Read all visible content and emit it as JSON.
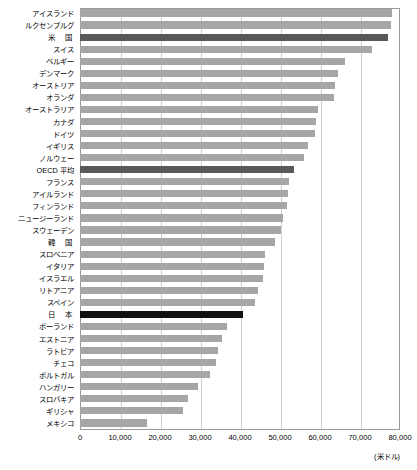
{
  "chart_data": {
    "type": "bar",
    "orientation": "horizontal",
    "title": "",
    "xlabel": "",
    "ylabel": "",
    "unit_label": "(米ドル)",
    "xlim": [
      0,
      80000
    ],
    "xticks": [
      0,
      10000,
      20000,
      30000,
      40000,
      50000,
      60000,
      70000,
      80000
    ],
    "xtick_labels": [
      "0",
      "10,000",
      "20,000",
      "30,000",
      "40,000",
      "50,000",
      "60,000",
      "70,000",
      "80,000"
    ],
    "grid": true,
    "grid_axis": "x",
    "legend": "none",
    "categories": [
      "アイスランド",
      "ルクセンブルグ",
      "米　国",
      "スイス",
      "ベルギー",
      "デンマーク",
      "オーストリア",
      "オランダ",
      "オーストラリア",
      "カナダ",
      "ドイツ",
      "イギリス",
      "ノルウェー",
      "OECD 平均",
      "フランス",
      "アイルランド",
      "フィンランド",
      "ニュージーランド",
      "スウェーデン",
      "韓　国",
      "スロベニア",
      "イタリア",
      "イスラエル",
      "リトアニア",
      "スペイン",
      "日　本",
      "ポーランド",
      "エストニア",
      "ラトビア",
      "チェコ",
      "ポルトガル",
      "ハンガリー",
      "スロバキア",
      "ギリシャ",
      "メキシコ"
    ],
    "values": [
      78000,
      77750,
      77000,
      73000,
      66250,
      64500,
      63750,
      63500,
      59500,
      59000,
      58750,
      57000,
      56000,
      53500,
      52250,
      52000,
      51750,
      50750,
      50250,
      48750,
      46250,
      46000,
      45750,
      44500,
      43750,
      40750,
      36750,
      35500,
      34500,
      34000,
      32500,
      29500,
      27000,
      25750,
      16750
    ],
    "highlights": {
      "米　国": "dark",
      "OECD 平均": "dark",
      "日　本": "black"
    },
    "colors": {
      "bar_default": "#a6a6a6",
      "bar_dark": "#595959",
      "bar_black": "#111111",
      "gridline": "#cfcfcf",
      "axis": "#9a9a9a",
      "background": "#ffffff",
      "text": "#000000"
    }
  }
}
